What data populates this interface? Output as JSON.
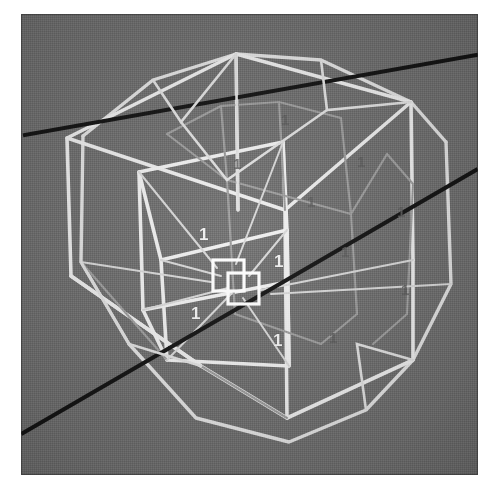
{
  "figure": {
    "background_color": "#6f6f6f",
    "page_background_color": "#ffffff",
    "wire_color": "#e8e8e8",
    "wire_color_dim": "#b9b9b9",
    "axis_color": "#111111",
    "frame": {
      "x": 21,
      "y": 14,
      "width": 457,
      "height": 461
    }
  },
  "axes": [
    {
      "name": "axis-line-1",
      "x1": 4,
      "y1": 121,
      "x2": 455,
      "y2": 41,
      "color": "#111111",
      "width": 4
    },
    {
      "name": "axis-line-2",
      "x1": 2,
      "y1": 419,
      "x2": 455,
      "y2": 156,
      "color": "#111111",
      "width": 4
    }
  ],
  "labels": [
    {
      "text": "1",
      "x": 178,
      "y": 212,
      "style": "bright"
    },
    {
      "text": "1",
      "x": 253,
      "y": 239,
      "style": "bright"
    },
    {
      "text": "1",
      "x": 170,
      "y": 291,
      "style": "bright"
    },
    {
      "text": "1",
      "x": 252,
      "y": 318,
      "style": "bright"
    },
    {
      "text": "1",
      "x": 260,
      "y": 98,
      "style": "dim"
    },
    {
      "text": "1",
      "x": 336,
      "y": 140,
      "style": "dim"
    },
    {
      "text": "1",
      "x": 286,
      "y": 180,
      "style": "dim"
    },
    {
      "text": "1",
      "x": 376,
      "y": 190,
      "style": "dim"
    },
    {
      "text": "1",
      "x": 320,
      "y": 230,
      "style": "dim"
    },
    {
      "text": "1",
      "x": 380,
      "y": 268,
      "style": "dim"
    },
    {
      "text": "1",
      "x": 212,
      "y": 142,
      "style": "dim"
    },
    {
      "text": "1",
      "x": 308,
      "y": 316,
      "style": "dim"
    }
  ],
  "shapes": {
    "outer_hull": {
      "name": "outer-polyhedron",
      "vertices_top": "65 116, 153 58, 242 44, 334 52, 430 85",
      "description": "Outer convex hull wireframe (truncated-cube / dodecahedral silhouette)"
    },
    "inner_cube": {
      "name": "inner-cube",
      "description": "Inner axis-aligned cube in perspective"
    },
    "center_squares": {
      "name": "center-squares",
      "count": 2,
      "description": "Two small overlapping squares at origin"
    }
  },
  "center_markers": [
    {
      "name": "center-square-a",
      "x": 192,
      "y": 246,
      "size": 31
    },
    {
      "name": "center-square-b",
      "x": 207,
      "y": 259,
      "size": 31
    }
  ]
}
